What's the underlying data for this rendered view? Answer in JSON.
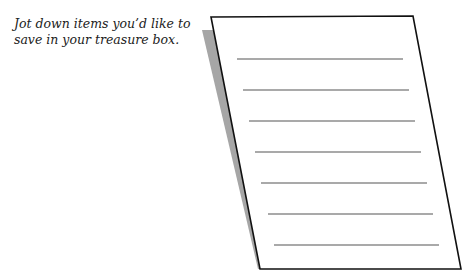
{
  "prompt": {
    "text": "Jot down items you’d like to save in your treasure box."
  },
  "note_sheet": {
    "line_count": 7,
    "colors": {
      "paper": "#ffffff",
      "border": "#111111",
      "shadow": "#a6a6a6",
      "rule": "#555555"
    }
  }
}
